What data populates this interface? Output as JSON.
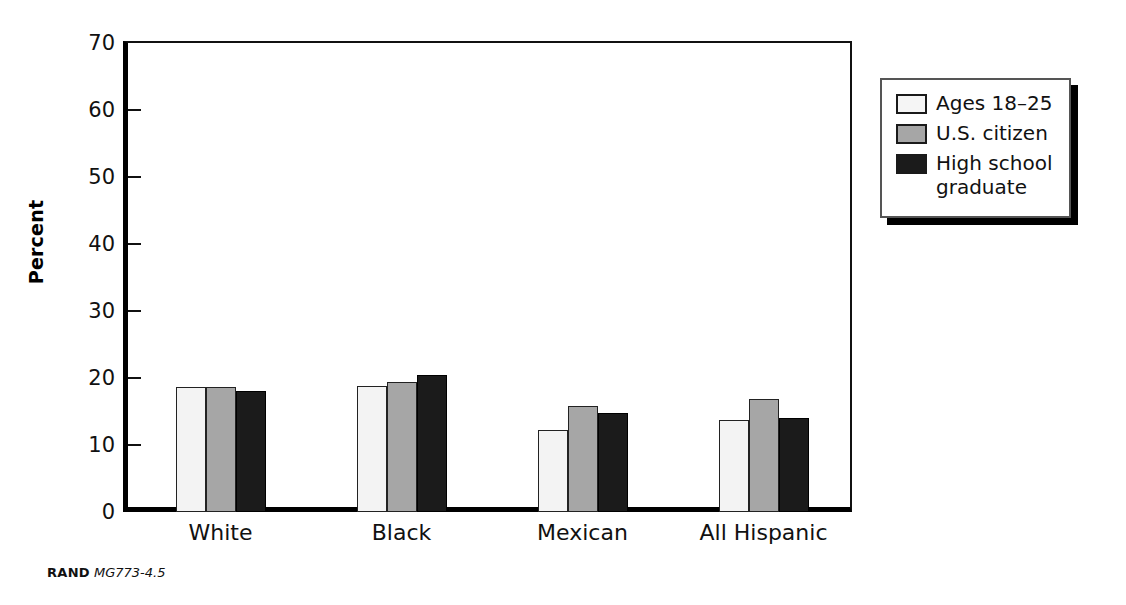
{
  "chart_data": {
    "type": "bar",
    "title": "",
    "xlabel": "",
    "ylabel": "Percent",
    "ylim": [
      0,
      70
    ],
    "yticks": [
      0,
      10,
      20,
      30,
      40,
      50,
      60,
      70
    ],
    "ytick_labels": [
      "0",
      "10",
      "20",
      "30",
      "40",
      "50",
      "60",
      "70"
    ],
    "grid": false,
    "legend_position": "right-top",
    "categories": [
      "White",
      "Black",
      "Mexican",
      "All Hispanic"
    ],
    "series": [
      {
        "name": "Ages 18–25",
        "color": "#f3f3f3",
        "values": [
          18.6,
          18.8,
          12.3,
          13.7
        ]
      },
      {
        "name": "U.S. citizen",
        "color": "#a6a6a6",
        "values": [
          18.7,
          19.4,
          15.8,
          16.9
        ]
      },
      {
        "name": "High school\ngraduate",
        "color": "#1b1b1b",
        "values": [
          18.1,
          20.4,
          14.8,
          14.1
        ]
      }
    ],
    "annotations": []
  },
  "legend": {
    "items": [
      {
        "label": "Ages 18–25",
        "swatch": "light-gray-swatch"
      },
      {
        "label": "U.S. citizen",
        "swatch": "medium-gray-swatch"
      },
      {
        "label": "High school\ngraduate",
        "swatch": "black-swatch"
      }
    ]
  },
  "footer": {
    "source": "RAND",
    "document_id": "MG773-4.5"
  },
  "colors": {
    "series_light": "#f3f3f3",
    "series_gray": "#a6a6a6",
    "series_black": "#1b1b1b",
    "axis": "#000000",
    "text": "#111111",
    "background": "#ffffff"
  }
}
